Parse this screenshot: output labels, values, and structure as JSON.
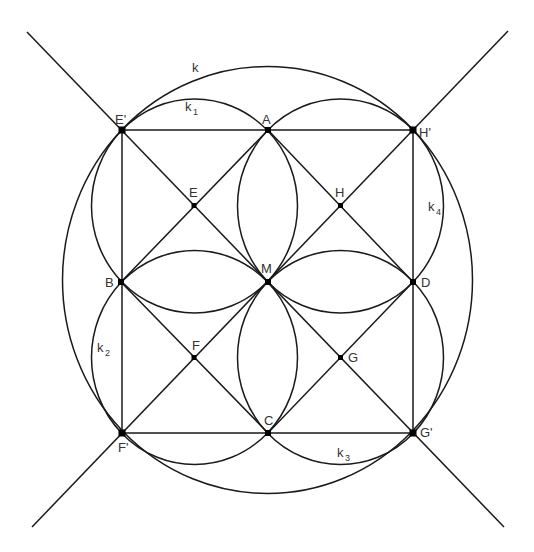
{
  "diagram": {
    "type": "geometric-construction",
    "colors": {
      "stroke": "#1a1a1a",
      "point": "#000000",
      "label": "#333333",
      "background": "#ffffff"
    },
    "circles": {
      "k": {
        "label": "k",
        "subscript": ""
      },
      "k1": {
        "label": "k",
        "subscript": "1"
      },
      "k2": {
        "label": "k",
        "subscript": "2"
      },
      "k3": {
        "label": "k",
        "subscript": "3"
      },
      "k4": {
        "label": "k",
        "subscript": "4"
      }
    },
    "points": {
      "A": "A",
      "B": "B",
      "C": "C",
      "D": "D",
      "E": "E",
      "F": "F",
      "G": "G",
      "H": "H",
      "M": "M",
      "E_prime": "E'",
      "F_prime": "F'",
      "G_prime": "G'",
      "H_prime": "H'"
    }
  }
}
